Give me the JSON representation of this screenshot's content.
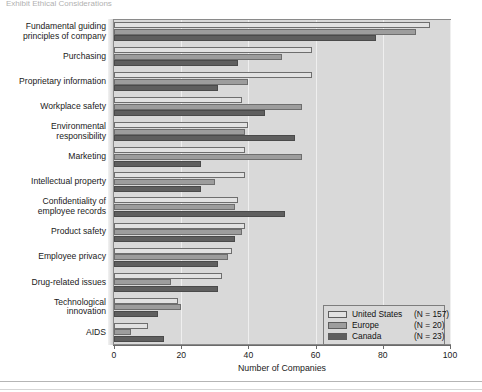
{
  "top_clipped_text": "Exhibit   Ethical Considerations",
  "chart_data": {
    "type": "bar",
    "orientation": "horizontal",
    "title": "",
    "xlabel": "Number of Companies",
    "ylabel": "",
    "xlim": [
      0,
      100
    ],
    "xticks": [
      0,
      20,
      40,
      60,
      80,
      100
    ],
    "grid": true,
    "legend_position": "bottom-right",
    "categories": [
      "Fundamental guiding principles of company",
      "Purchasing",
      "Proprietary information",
      "Workplace safety",
      "Environmental responsibility",
      "Marketing",
      "Intellectual property",
      "Confidentiality of employee records",
      "Product safety",
      "Employee privacy",
      "Drug-related issues",
      "Technological innovation",
      "AIDS"
    ],
    "series": [
      {
        "name": "United States",
        "n_label": "(N = 157)",
        "color": "#e2e2e2",
        "values": [
          94,
          59,
          59,
          38,
          40,
          39,
          39,
          37,
          39,
          35,
          32,
          19,
          10
        ]
      },
      {
        "name": "Europe",
        "n_label": "(N = 20)",
        "color": "#9d9d9d",
        "values": [
          90,
          50,
          40,
          56,
          39,
          56,
          30,
          36,
          38,
          34,
          17,
          20,
          5
        ]
      },
      {
        "name": "Canada",
        "n_label": "(N = 23)",
        "color": "#5f5f5f",
        "values": [
          78,
          37,
          31,
          45,
          54,
          26,
          26,
          51,
          36,
          31,
          31,
          13,
          15
        ]
      }
    ]
  },
  "ylabels": [
    [
      "Fundamental guiding",
      "principles of company"
    ],
    [
      "Purchasing"
    ],
    [
      "Proprietary information"
    ],
    [
      "Workplace safety"
    ],
    [
      "Environmental",
      "responsibility"
    ],
    [
      "Marketing"
    ],
    [
      "Intellectual property"
    ],
    [
      "Confidentiality of",
      "employee records"
    ],
    [
      "Product safety"
    ],
    [
      "Employee privacy"
    ],
    [
      "Drug-related issues"
    ],
    [
      "Technological",
      "innovation"
    ],
    [
      "AIDS"
    ]
  ],
  "colors": {
    "panel": "#d9d9d9",
    "us": "#e2e2e2",
    "europe": "#9d9d9d",
    "canada": "#5f5f5f",
    "axis": "#6a6a6a"
  }
}
